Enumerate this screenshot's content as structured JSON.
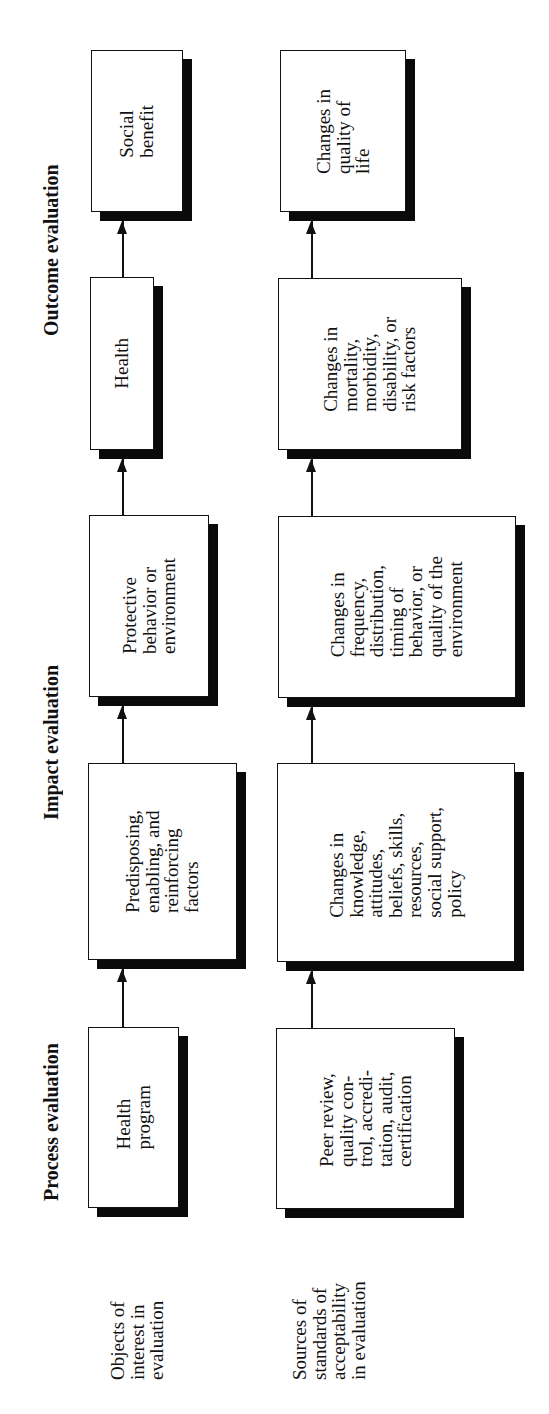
{
  "headers": {
    "process": "Process evaluation",
    "impact": "Impact evaluation",
    "outcome": "Outcome evaluation"
  },
  "row_labels": {
    "objects": "Objects of\ninterest in\nevaluation",
    "sources": "Sources of\nstandards of\nacceptability\nin evaluation"
  },
  "objects_row": [
    {
      "id": "health-program",
      "text": "Health\nprogram"
    },
    {
      "id": "predisposing-factors",
      "text": "Predisposing,\nenabling, and\nreinforcing\nfactors"
    },
    {
      "id": "protective-behavior",
      "text": "Protective\nbehavior or\nenvironment"
    },
    {
      "id": "health",
      "text": "Health"
    },
    {
      "id": "social-benefit",
      "text": "Social\nbenefit"
    }
  ],
  "sources_row": [
    {
      "id": "peer-review",
      "text": "Peer review,\nquality con-\ntrol, accredi-\ntation, audit,\ncertification"
    },
    {
      "id": "changes-knowledge",
      "text": "Changes in\nknowledge,\nattitudes,\nbeliefs, skills,\nresources,\nsocial support,\npolicy"
    },
    {
      "id": "changes-frequency",
      "text": "Changes in\nfrequency,\ndistribution,\ntiming of\nbehavior, or\nquality of the\nenvironment"
    },
    {
      "id": "changes-mortality",
      "text": "Changes in\nmortality,\nmorbidity,\ndisability, or\nrisk factors"
    },
    {
      "id": "changes-quality-life",
      "text": "Changes in\nquality of\nlife"
    }
  ],
  "colors": {
    "stroke": "#111111",
    "shadow": "#0a0a0a",
    "background": "#ffffff"
  }
}
